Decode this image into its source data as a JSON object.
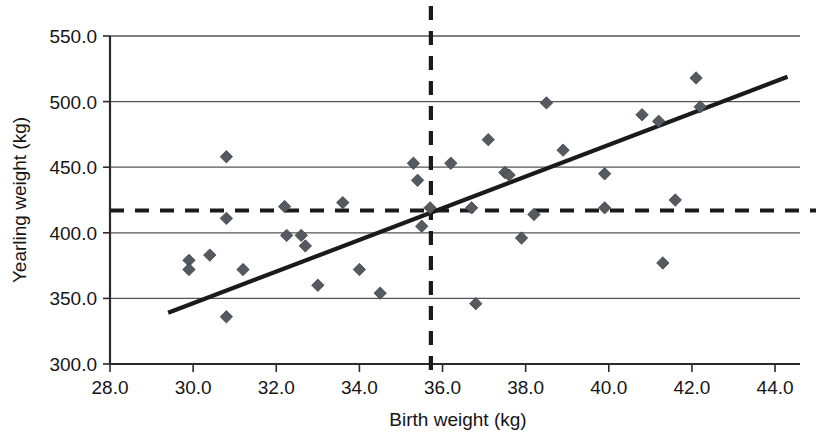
{
  "chart_data": {
    "type": "scatter",
    "title": "",
    "xlabel": "Birth weight (kg)",
    "ylabel": "Yearling weight (kg)",
    "xlim": [
      28.0,
      44.6
    ],
    "ylim": [
      300.0,
      550.0
    ],
    "xticks": [
      "28.0",
      "30.0",
      "32.0",
      "34.0",
      "36.0",
      "38.0",
      "40.0",
      "42.0",
      "44.0"
    ],
    "xtick_values": [
      28.0,
      30.0,
      32.0,
      34.0,
      36.0,
      38.0,
      40.0,
      42.0,
      44.0
    ],
    "yticks": [
      "300.0",
      "350.0",
      "400.0",
      "450.0",
      "500.0",
      "550.0"
    ],
    "ytick_values": [
      300.0,
      350.0,
      400.0,
      450.0,
      500.0,
      550.0
    ],
    "grid": "horizontal",
    "legend": "none",
    "marker_shape": "diamond",
    "marker_color": "#555a60",
    "line_color": "#1a1a1a",
    "points": [
      {
        "x": 29.9,
        "y": 379.0
      },
      {
        "x": 29.9,
        "y": 372.0
      },
      {
        "x": 30.4,
        "y": 383.0
      },
      {
        "x": 30.8,
        "y": 458.0
      },
      {
        "x": 30.8,
        "y": 411.0
      },
      {
        "x": 30.8,
        "y": 336.0
      },
      {
        "x": 31.2,
        "y": 372.0
      },
      {
        "x": 32.2,
        "y": 420.0
      },
      {
        "x": 32.25,
        "y": 398.0
      },
      {
        "x": 32.6,
        "y": 398.0
      },
      {
        "x": 32.7,
        "y": 390.0
      },
      {
        "x": 33.0,
        "y": 360.0
      },
      {
        "x": 33.6,
        "y": 423.0
      },
      {
        "x": 34.0,
        "y": 372.0
      },
      {
        "x": 34.5,
        "y": 354.0
      },
      {
        "x": 35.3,
        "y": 453.0
      },
      {
        "x": 35.4,
        "y": 440.0
      },
      {
        "x": 35.5,
        "y": 405.0
      },
      {
        "x": 35.7,
        "y": 419.0
      },
      {
        "x": 36.2,
        "y": 453.0
      },
      {
        "x": 36.7,
        "y": 419.0
      },
      {
        "x": 36.8,
        "y": 346.0
      },
      {
        "x": 37.1,
        "y": 471.0
      },
      {
        "x": 37.5,
        "y": 446.0
      },
      {
        "x": 37.6,
        "y": 444.0
      },
      {
        "x": 37.9,
        "y": 396.0
      },
      {
        "x": 38.2,
        "y": 414.0
      },
      {
        "x": 38.5,
        "y": 499.0
      },
      {
        "x": 38.9,
        "y": 463.0
      },
      {
        "x": 39.9,
        "y": 445.0
      },
      {
        "x": 39.9,
        "y": 419.0
      },
      {
        "x": 40.8,
        "y": 490.0
      },
      {
        "x": 41.2,
        "y": 485.0
      },
      {
        "x": 41.3,
        "y": 377.0
      },
      {
        "x": 41.6,
        "y": 425.0
      },
      {
        "x": 42.1,
        "y": 518.0
      },
      {
        "x": 42.2,
        "y": 496.0
      }
    ],
    "trend_line": {
      "style": "solid",
      "x0": 29.4,
      "y0": 339.0,
      "x1": 44.3,
      "y1": 519.0
    },
    "reference_lines": [
      {
        "orientation": "horizontal",
        "style": "dashed",
        "value": 417.0
      },
      {
        "orientation": "vertical",
        "style": "dashed",
        "value": 35.72
      }
    ]
  }
}
